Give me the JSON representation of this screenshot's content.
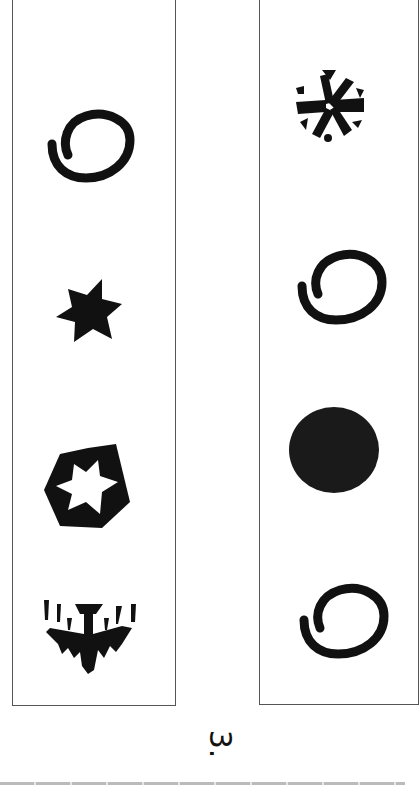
{
  "figure": {
    "label": "3.",
    "panels": [
      {
        "id": "left",
        "symbols": [
          {
            "name": "spiral-circle-icon",
            "description": "open spiral circle"
          },
          {
            "name": "six-point-star-icon",
            "description": "filled six-pointed star"
          },
          {
            "name": "pentagon-star-icon",
            "description": "pentagon with six-pointed star cut-out"
          },
          {
            "name": "bat-drip-icon",
            "description": "bat-like shape with drips"
          }
        ]
      },
      {
        "id": "right",
        "symbols": [
          {
            "name": "asterisk-circle-icon",
            "description": "asterisk with triangles in circle"
          },
          {
            "name": "spiral-circle-icon",
            "description": "open spiral circle"
          },
          {
            "name": "filled-circle-icon",
            "description": "solid black disc"
          },
          {
            "name": "spiral-circle-icon",
            "description": "open spiral circle"
          }
        ]
      }
    ],
    "colors": {
      "ink": "#111111",
      "border": "#555555",
      "background": "#ffffff"
    }
  }
}
